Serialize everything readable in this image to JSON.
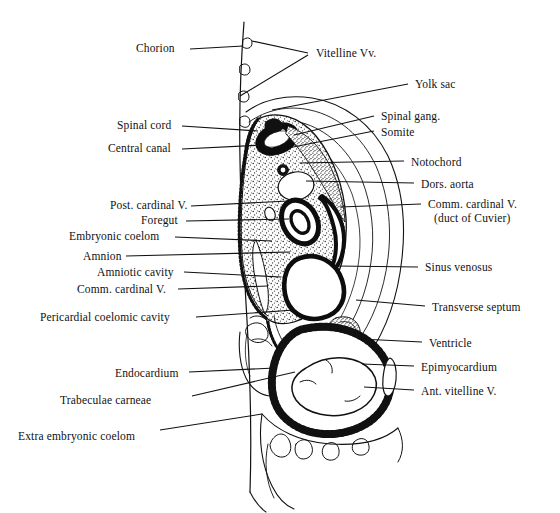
{
  "figure": {
    "type": "anatomical-diagram",
    "background_color": "#ffffff",
    "ink_color": "#111111"
  },
  "labels_left": [
    {
      "id": "chorion",
      "text": "Chorion",
      "x": 136,
      "y": 42,
      "leader": [
        [
          190,
          49
        ],
        [
          243,
          46
        ]
      ]
    },
    {
      "id": "spinal-cord",
      "text": "Spinal cord",
      "x": 117,
      "y": 119,
      "leader": [
        [
          182,
          126
        ],
        [
          258,
          131
        ]
      ]
    },
    {
      "id": "central-canal",
      "text": "Central canal",
      "x": 108,
      "y": 142,
      "leader": [
        [
          182,
          149
        ],
        [
          264,
          145
        ]
      ]
    },
    {
      "id": "post-cardinal-v",
      "text": "Post. cardinal V.",
      "x": 110,
      "y": 199,
      "leader": [
        [
          191,
          206
        ],
        [
          288,
          201
        ]
      ]
    },
    {
      "id": "foregut",
      "text": "Foregut",
      "x": 141,
      "y": 214,
      "leader": [
        [
          186,
          221
        ],
        [
          289,
          219
        ]
      ]
    },
    {
      "id": "embryonic-coelom",
      "text": "Embryonic coelom",
      "x": 69,
      "y": 230,
      "leader": [
        [
          175,
          237
        ],
        [
          272,
          241
        ]
      ]
    },
    {
      "id": "amnion",
      "text": "Amnion",
      "x": 83,
      "y": 250,
      "leader": [
        [
          126,
          256
        ],
        [
          290,
          252
        ]
      ]
    },
    {
      "id": "amniotic-cavity",
      "text": "Amniotic cavity",
      "x": 97,
      "y": 266,
      "leader": [
        [
          184,
          272
        ],
        [
          281,
          277
        ]
      ]
    },
    {
      "id": "comm-cardinal-v-left",
      "text": "Comm. cardinal V.",
      "x": 77,
      "y": 283,
      "leader": [
        [
          178,
          289
        ],
        [
          268,
          286
        ]
      ]
    },
    {
      "id": "pericardial-coelomic",
      "text": "Pericardial coelomic cavity",
      "x": 40,
      "y": 311,
      "leader": [
        [
          196,
          317
        ],
        [
          294,
          310
        ]
      ]
    },
    {
      "id": "endocardium",
      "text": "Endocardium",
      "x": 115,
      "y": 367,
      "leader": [
        [
          189,
          372
        ],
        [
          275,
          368
        ]
      ]
    },
    {
      "id": "trabeculae-carneae",
      "text": "Trabeculae carneae",
      "x": 60,
      "y": 394,
      "leader": [
        [
          192,
          396
        ],
        [
          295,
          372
        ]
      ]
    },
    {
      "id": "extra-embryonic-coelom",
      "text": "Extra embryonic coelom",
      "x": 18,
      "y": 430,
      "leader": [
        [
          160,
          430
        ],
        [
          262,
          414
        ]
      ]
    }
  ],
  "labels_right": [
    {
      "id": "vitelline-vv",
      "text": "Vitelline Vv.",
      "x": 316,
      "y": 47,
      "leader": [
        [
          308,
          53
        ],
        [
          252,
          41
        ]
      ],
      "leader2": [
        [
          308,
          55
        ],
        [
          240,
          96
        ]
      ]
    },
    {
      "id": "yolk-sac",
      "text": "Yolk sac",
      "x": 415,
      "y": 78,
      "leader": [
        [
          408,
          84
        ],
        [
          272,
          110
        ]
      ]
    },
    {
      "id": "spinal-gang",
      "text": "Spinal gang.",
      "x": 381,
      "y": 110,
      "leader": [
        [
          374,
          116
        ],
        [
          294,
          135
        ]
      ]
    },
    {
      "id": "somite",
      "text": "Somite",
      "x": 381,
      "y": 126,
      "leader": [
        [
          374,
          131
        ],
        [
          288,
          148
        ]
      ]
    },
    {
      "id": "notochord",
      "text": "Notochord",
      "x": 411,
      "y": 156,
      "leader": [
        [
          404,
          161
        ],
        [
          300,
          163
        ]
      ]
    },
    {
      "id": "dors-aorta",
      "text": "Dors. aorta",
      "x": 421,
      "y": 178,
      "leader": [
        [
          414,
          183
        ],
        [
          306,
          181
        ]
      ]
    },
    {
      "id": "comm-cardinal-v-right",
      "text": "Comm. cardinal V.",
      "x": 428,
      "y": 198,
      "leader": [
        [
          421,
          204
        ],
        [
          340,
          207
        ]
      ]
    },
    {
      "id": "duct-of-cuvier",
      "text": "(duct of Cuvier)",
      "x": 434,
      "y": 212
    },
    {
      "id": "sinus-venosus",
      "text": "Sinus venosus",
      "x": 425,
      "y": 261,
      "leader": [
        [
          418,
          267
        ],
        [
          336,
          266
        ]
      ]
    },
    {
      "id": "transverse-septum",
      "text": "Transverse septum",
      "x": 432,
      "y": 301,
      "leader": [
        [
          425,
          306
        ],
        [
          356,
          300
        ]
      ]
    },
    {
      "id": "ventricle",
      "text": "Ventricle",
      "x": 429,
      "y": 337,
      "leader": [
        [
          422,
          342
        ],
        [
          360,
          339
        ]
      ]
    },
    {
      "id": "epimyocardium",
      "text": "Epimyocardium",
      "x": 421,
      "y": 361,
      "leader": [
        [
          414,
          366
        ],
        [
          362,
          364
        ]
      ]
    },
    {
      "id": "ant-vitelline-v",
      "text": "Ant. vitelline V.",
      "x": 421,
      "y": 385,
      "leader": [
        [
          414,
          390
        ],
        [
          364,
          387
        ]
      ]
    }
  ]
}
